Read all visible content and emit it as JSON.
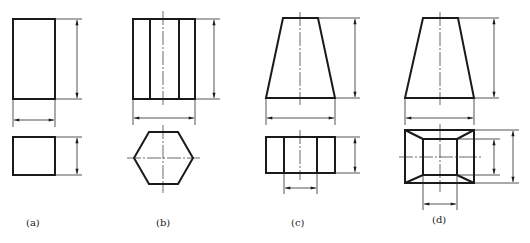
{
  "figure": {
    "panels": [
      {
        "id": "a",
        "label": "(a)",
        "solid": "rectangular prism",
        "views": [
          "front",
          "top"
        ]
      },
      {
        "id": "b",
        "label": "(b)",
        "solid": "hexagonal prism",
        "views": [
          "front",
          "top"
        ]
      },
      {
        "id": "c",
        "label": "(c)",
        "solid": "truncated pyramid (frustum) – rectangular base",
        "views": [
          "front",
          "top"
        ]
      },
      {
        "id": "d",
        "label": "(d)",
        "solid": "truncated square pyramid (frustum)",
        "views": [
          "front",
          "top"
        ]
      }
    ]
  },
  "colors": {
    "line": "#1a1a1a",
    "background": "#ffffff"
  }
}
